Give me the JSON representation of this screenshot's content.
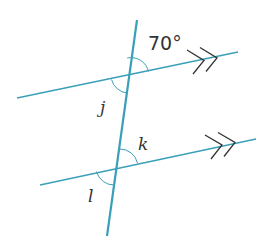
{
  "diagram": {
    "type": "parallel lines cut by a transversal",
    "colors": {
      "line": "#3a9fb8",
      "arc": "#3a9fb8",
      "arrow": "#333333",
      "text": "#333333",
      "background": "#ffffff"
    },
    "transversal": {
      "x1": 137,
      "y1": 20,
      "x2": 107,
      "y2": 236
    },
    "parallel_lines": [
      {
        "name": "upper",
        "x1": 17,
        "y1": 98,
        "x2": 238,
        "y2": 52,
        "arrow_marks": ">>"
      },
      {
        "name": "lower",
        "x1": 40,
        "y1": 185,
        "x2": 256,
        "y2": 139,
        "arrow_marks": ">>"
      }
    ],
    "angles": [
      {
        "label": "70°",
        "position": "upper intersection, above-right",
        "value_deg": 70
      },
      {
        "label": "j",
        "position": "upper intersection, below-left"
      },
      {
        "label": "k",
        "position": "lower intersection, above-right"
      },
      {
        "label": "l",
        "position": "lower intersection, below-left"
      }
    ]
  }
}
